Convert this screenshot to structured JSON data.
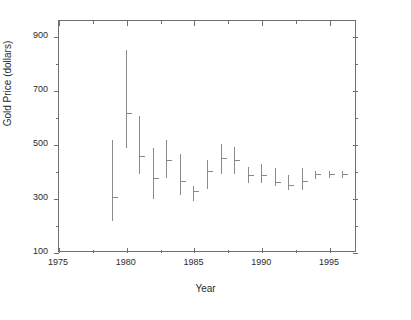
{
  "chart_data": {
    "type": "bar",
    "subtype": "high-low-close range bars",
    "title": "",
    "xlabel": "Year",
    "ylabel": "Gold Price (dollars)",
    "xlim": [
      1975,
      1997
    ],
    "ylim": [
      100,
      960
    ],
    "grid": false,
    "legend": null,
    "x_ticks": [
      1975,
      1980,
      1985,
      1990,
      1995
    ],
    "x_tick_labels": [
      "1975",
      "1980",
      "1985",
      "1990",
      "1995"
    ],
    "x_minor_tick_interval": 2.5,
    "y_ticks": [
      100,
      300,
      500,
      700,
      900
    ],
    "y_tick_labels": [
      "100",
      "300",
      "500",
      "700",
      "900"
    ],
    "y_minor_tick_interval": 100,
    "series": [
      {
        "name": "Gold Price",
        "color": "#8a8a8a",
        "x": [
          1979,
          1980,
          1981,
          1982,
          1983,
          1984,
          1985,
          1986,
          1987,
          1988,
          1989,
          1990,
          1991,
          1992,
          1993,
          1994,
          1995,
          1996
        ],
        "high": [
          515,
          850,
          605,
          485,
          515,
          465,
          345,
          440,
          500,
          490,
          415,
          425,
          410,
          385,
          410,
          400,
          400,
          400
        ],
        "low": [
          215,
          485,
          390,
          295,
          375,
          310,
          290,
          335,
          390,
          390,
          355,
          355,
          345,
          330,
          330,
          370,
          375,
          375
        ],
        "close": [
          305,
          615,
          455,
          375,
          440,
          365,
          325,
          400,
          450,
          440,
          385,
          385,
          360,
          350,
          365,
          390,
          390,
          390
        ]
      }
    ]
  },
  "axes": {
    "y_title": "Gold Price (dollars)",
    "x_title": "Year"
  }
}
